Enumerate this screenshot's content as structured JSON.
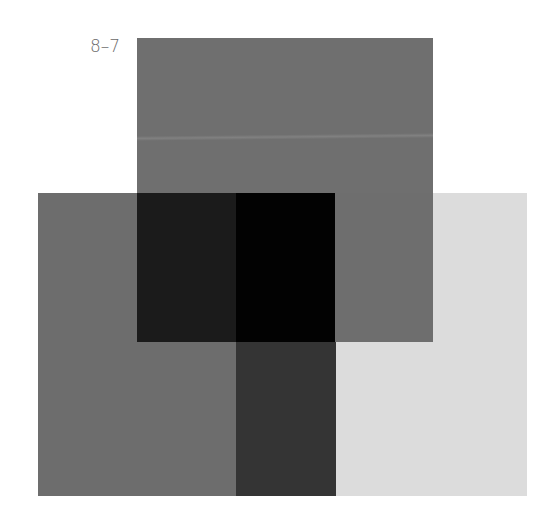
{
  "figure": {
    "label": "8–7",
    "colors": {
      "background": "#ffffff",
      "label_text": "#6a6a6a",
      "top_panel": "#6f6f6f",
      "left_panel": "#6d6d6d",
      "overlap_top_left": "#1b1b1b",
      "overlap_center": "#020202",
      "middle_strip": "#343434",
      "overlap_top_right": "#6e6e6e",
      "light_panel": "#dcdcdc"
    }
  }
}
